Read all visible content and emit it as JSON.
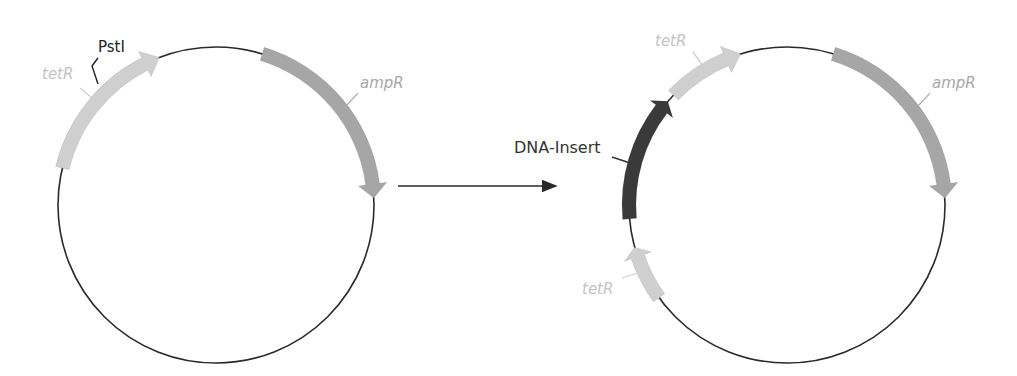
{
  "diagram": {
    "type": "plasmid-cloning",
    "colors": {
      "backbone": "#2a2a2a",
      "tetR": "#cfcfcf",
      "ampR": "#a6a6a6",
      "insert": "#3a3a3a",
      "label_light": "#c4c4c4",
      "label_mid": "#a8a8a8",
      "label_dark": "#333333"
    },
    "left_plasmid": {
      "labels": {
        "tetR": "tetR",
        "pstI": "PstI",
        "ampR": "ampR"
      }
    },
    "arrow": {
      "direction": "right"
    },
    "right_plasmid": {
      "labels": {
        "tetR_top": "tetR",
        "insert": "DNA-Insert",
        "tetR_bottom": "tetR",
        "ampR": "ampR"
      }
    }
  }
}
